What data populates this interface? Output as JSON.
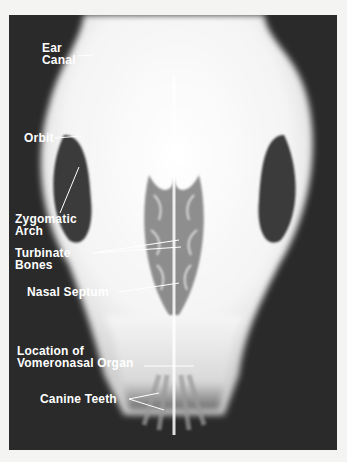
{
  "figure": {
    "labels": [
      {
        "id": "ear-canal",
        "lines": [
          "Ear",
          "Canal"
        ]
      },
      {
        "id": "orbit",
        "lines": [
          "Orbit"
        ]
      },
      {
        "id": "zygomatic-arch",
        "lines": [
          "Zygomatic",
          "Arch"
        ]
      },
      {
        "id": "turbinate-bones",
        "lines": [
          "Turbinate",
          "Bones"
        ]
      },
      {
        "id": "nasal-septum",
        "lines": [
          "Nasal Septum"
        ]
      },
      {
        "id": "vomeronasal-organ",
        "lines": [
          "Location of",
          "Vomeronasal Organ"
        ]
      },
      {
        "id": "canine-teeth",
        "lines": [
          "Canine Teeth"
        ]
      }
    ]
  },
  "colors": {
    "background": "#2a2a2a",
    "bone": "#ffffff",
    "page": "#f4f4f2"
  }
}
